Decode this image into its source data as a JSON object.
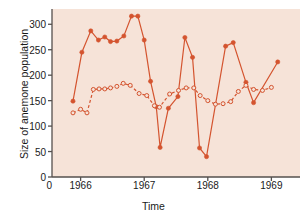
{
  "chart_data": {
    "type": "line",
    "title": "",
    "xlabel": "Time",
    "ylabel": "Size of anemone population",
    "xlim": [
      1965.55,
      1969.45
    ],
    "ylim": [
      0,
      330
    ],
    "yticks": [
      0,
      50,
      100,
      150,
      200,
      250,
      300
    ],
    "xticks": [
      1966,
      1967,
      1968,
      1969
    ],
    "xticklabels": [
      "1966",
      "1967",
      "1968",
      "1969"
    ],
    "grid": false,
    "legend": "none",
    "axis_origin_label": "0",
    "background": "#f6e3d8",
    "accent": "#d4542f",
    "series": [
      {
        "name": "solid-filled",
        "marker": "filled-circle",
        "linestyle": "solid",
        "color": "#d4542f",
        "points": [
          [
            1965.88,
            149
          ],
          [
            1966.02,
            245
          ],
          [
            1966.16,
            287
          ],
          [
            1966.28,
            269
          ],
          [
            1966.38,
            275
          ],
          [
            1966.47,
            266
          ],
          [
            1966.57,
            267
          ],
          [
            1966.68,
            277
          ],
          [
            1966.8,
            316
          ],
          [
            1966.9,
            316
          ],
          [
            1967.0,
            269
          ],
          [
            1967.1,
            188
          ],
          [
            1967.19,
            138
          ],
          [
            1967.25,
            58
          ],
          [
            1967.38,
            135
          ],
          [
            1967.53,
            158
          ],
          [
            1967.64,
            274
          ],
          [
            1967.76,
            235
          ],
          [
            1967.87,
            57
          ],
          [
            1967.98,
            40
          ],
          [
            1968.28,
            257
          ],
          [
            1968.4,
            264
          ],
          [
            1968.6,
            186
          ],
          [
            1968.72,
            146
          ],
          [
            1969.1,
            226
          ]
        ]
      },
      {
        "name": "dashed-open",
        "marker": "open-circle",
        "linestyle": "dashed",
        "color": "#d4542f",
        "points": [
          [
            1965.88,
            126
          ],
          [
            1966.0,
            133
          ],
          [
            1966.1,
            126
          ],
          [
            1966.2,
            172
          ],
          [
            1966.29,
            173
          ],
          [
            1966.38,
            173
          ],
          [
            1966.47,
            175
          ],
          [
            1966.57,
            178
          ],
          [
            1966.67,
            184
          ],
          [
            1966.78,
            180
          ],
          [
            1966.92,
            164
          ],
          [
            1967.04,
            160
          ],
          [
            1967.16,
            140
          ],
          [
            1967.24,
            137
          ],
          [
            1967.4,
            163
          ],
          [
            1967.54,
            170
          ],
          [
            1967.66,
            175
          ],
          [
            1967.78,
            175
          ],
          [
            1967.88,
            160
          ],
          [
            1968.0,
            150
          ],
          [
            1968.12,
            143
          ],
          [
            1968.24,
            144
          ],
          [
            1968.36,
            148
          ],
          [
            1968.48,
            168
          ],
          [
            1968.6,
            180
          ],
          [
            1968.72,
            172
          ],
          [
            1968.86,
            170
          ],
          [
            1969.0,
            176
          ]
        ]
      }
    ]
  },
  "labels": {
    "ylabel": "Size of anemone population",
    "xlabel": "Time",
    "zero": "0"
  }
}
